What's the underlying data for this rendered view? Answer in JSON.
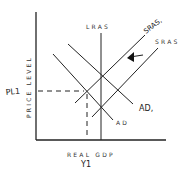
{
  "diagram": {
    "type": "AD-AS model",
    "axes": {
      "x_label": "REAL GDP",
      "y_label": "PRICE LEVEL"
    },
    "curves": {
      "lras": "LRAS",
      "sras": "SRAS",
      "sras1": "SRAS,",
      "ad": "AD",
      "ad1": "AD,"
    },
    "annotations": {
      "price_level_marker": "PL1",
      "output_marker": "Y1",
      "shift_arrow": "left-arrow"
    }
  }
}
